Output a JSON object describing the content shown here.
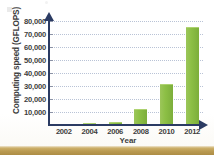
{
  "chart_data": {
    "type": "bar",
    "title": "",
    "xlabel": "Year",
    "ylabel": "Computing speed (GFLOPS)",
    "categories": [
      "2002",
      "2004",
      "2006",
      "2008",
      "2010",
      "2012"
    ],
    "values": [
      1000,
      1800,
      2400,
      12600,
      31500,
      75500
    ],
    "ylim": [
      0,
      84000
    ],
    "yticks": [
      "10,000",
      "20,000",
      "30,000",
      "40,000",
      "50,000",
      "60,000",
      "70,000",
      "80,000"
    ],
    "ytick_values": [
      10000,
      20000,
      30000,
      40000,
      50000,
      60000,
      70000,
      80000
    ],
    "grid": "horizontal-dotted",
    "legend": "none",
    "bar_color": "#8cbf45",
    "axis_color": "#2b3b63",
    "grid_color": "#b9c3d6",
    "text_color": "#3d3d3d"
  },
  "figure": {
    "bottom_band_color": "#bb9b52"
  }
}
